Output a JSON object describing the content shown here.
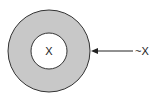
{
  "diagram": {
    "inner_label": "X",
    "outer_label": "~X",
    "colors": {
      "ring_fill": "#c8c8c8",
      "inner_fill": "#ffffff",
      "stroke": "#333333"
    }
  }
}
